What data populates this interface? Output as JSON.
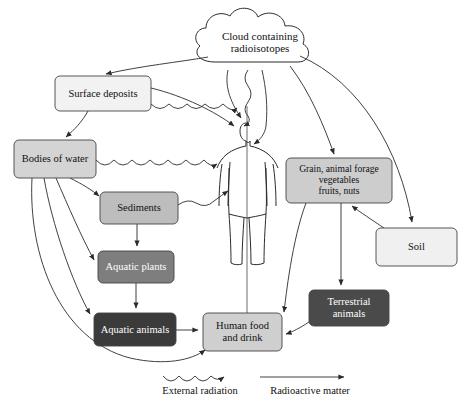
{
  "diagram": {
    "background": "#ffffff",
    "stroke": "#2b2b2b"
  },
  "nodes": {
    "cloud": {
      "label": "Cloud containing radioisotopes",
      "lines": [
        "Cloud containing",
        "radioisotopes"
      ],
      "fill": "#ffffff",
      "text_color": "#111111",
      "x": 196,
      "y": 12,
      "w": 128,
      "h": 58
    },
    "surface": {
      "label": "Surface deposits",
      "lines": [
        "Surface deposits"
      ],
      "fill": "#f2f2f2",
      "text_color": "#111111",
      "x": 55,
      "y": 76,
      "w": 96,
      "h": 35,
      "font_size": 10.5
    },
    "water": {
      "label": "Bodies of water",
      "lines": [
        "Bodies of water"
      ],
      "fill": "#d4d4d4",
      "text_color": "#111111",
      "x": 14,
      "y": 140,
      "w": 82,
      "h": 38,
      "font_size": 10.5
    },
    "sediments": {
      "label": "Sediments",
      "lines": [
        "Sediments"
      ],
      "fill": "#bdbdbd",
      "text_color": "#111111",
      "x": 100,
      "y": 192,
      "w": 78,
      "h": 32,
      "font_size": 10.5
    },
    "aq_plants": {
      "label": "Aquatic plants",
      "lines": [
        "Aquatic plants"
      ],
      "fill": "#7e7e7e",
      "text_color": "#ffffff",
      "x": 98,
      "y": 251,
      "w": 76,
      "h": 32,
      "font_size": 10.5
    },
    "aq_animals": {
      "label": "Aquatic animals",
      "lines": [
        "Aquatic animals"
      ],
      "fill": "#3b3b3b",
      "text_color": "#ffffff",
      "x": 94,
      "y": 313,
      "w": 82,
      "h": 33,
      "font_size": 10.5
    },
    "food": {
      "label": "Human food and drink",
      "lines": [
        "Human food",
        "and drink"
      ],
      "fill": "#cfcfcf",
      "text_color": "#111111",
      "x": 203,
      "y": 313,
      "w": 79,
      "h": 38,
      "font_size": 10.5
    },
    "grain": {
      "label": "Grain, animal forage vegetables fruits, nuts",
      "lines": [
        "Grain, animal forage",
        "vegetables",
        "fruits, nuts"
      ],
      "fill": "#cdcdcd",
      "text_color": "#111111",
      "x": 286,
      "y": 158,
      "w": 106,
      "h": 45,
      "font_size": 9.6
    },
    "soil": {
      "label": "Soil",
      "lines": [
        "Soil"
      ],
      "fill": "#f0f0f0",
      "text_color": "#111111",
      "x": 376,
      "y": 228,
      "w": 81,
      "h": 38,
      "font_size": 10.5
    },
    "terrestrial": {
      "label": "Terrestrial animals",
      "lines": [
        "Terrestrial",
        "animals"
      ],
      "fill": "#4a4a4a",
      "text_color": "#ffffff",
      "x": 309,
      "y": 290,
      "w": 80,
      "h": 36,
      "font_size": 10.5
    }
  },
  "human_figure": {
    "name": "human-body-outline",
    "description": "Outline drawing of a standing human body at center of diagram"
  },
  "legend": {
    "external_radiation": {
      "label": "External radiation",
      "style": "wavy-arrow"
    },
    "radioactive_matter": {
      "label": "Radioactive matter",
      "style": "straight-arrow"
    }
  },
  "edges": [
    {
      "from": "cloud",
      "to": "surface",
      "type": "radioactive-matter"
    },
    {
      "from": "cloud",
      "to": "human",
      "type": "radioactive-matter"
    },
    {
      "from": "cloud",
      "to": "grain",
      "type": "radioactive-matter"
    },
    {
      "from": "cloud",
      "to": "soil",
      "type": "radioactive-matter"
    },
    {
      "from": "cloud",
      "to": "human",
      "type": "external-radiation"
    },
    {
      "from": "surface",
      "to": "water",
      "type": "radioactive-matter"
    },
    {
      "from": "surface",
      "to": "human",
      "type": "radioactive-matter"
    },
    {
      "from": "surface",
      "to": "human",
      "type": "external-radiation"
    },
    {
      "from": "water",
      "to": "sediments",
      "type": "radioactive-matter"
    },
    {
      "from": "water",
      "to": "aq_plants",
      "type": "radioactive-matter"
    },
    {
      "from": "water",
      "to": "aq_animals",
      "type": "radioactive-matter"
    },
    {
      "from": "water",
      "to": "food",
      "type": "radioactive-matter"
    },
    {
      "from": "water",
      "to": "human",
      "type": "external-radiation"
    },
    {
      "from": "sediments",
      "to": "aq_plants",
      "type": "radioactive-matter"
    },
    {
      "from": "sediments",
      "to": "human",
      "type": "external-radiation"
    },
    {
      "from": "aq_plants",
      "to": "aq_animals",
      "type": "radioactive-matter"
    },
    {
      "from": "aq_animals",
      "to": "food",
      "type": "radioactive-matter"
    },
    {
      "from": "soil",
      "to": "grain",
      "type": "radioactive-matter"
    },
    {
      "from": "grain",
      "to": "terrestrial",
      "type": "radioactive-matter"
    },
    {
      "from": "grain",
      "to": "food",
      "type": "radioactive-matter"
    },
    {
      "from": "terrestrial",
      "to": "food",
      "type": "radioactive-matter"
    }
  ]
}
